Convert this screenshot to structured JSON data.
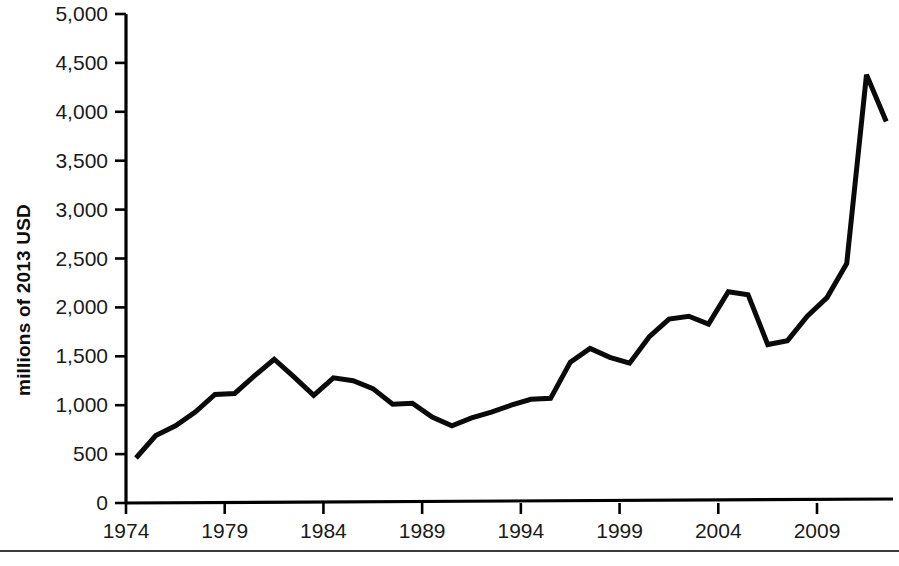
{
  "chart_data": {
    "type": "line",
    "title": "",
    "subtitle": "",
    "xlabel": "",
    "ylabel": "millions of 2013 USD",
    "xlim": [
      1974,
      2012
    ],
    "ylim": [
      0,
      5000
    ],
    "ytick_values": [
      0,
      500,
      1000,
      1500,
      2000,
      2500,
      3000,
      3500,
      4000,
      4500,
      5000
    ],
    "ytick_labels": [
      "0",
      "500",
      "1,000",
      "1,500",
      "2,000",
      "2,500",
      "3,000",
      "3,500",
      "4,000",
      "4,500",
      "5,000"
    ],
    "xtick_values": [
      1974,
      1979,
      1984,
      1989,
      1994,
      1999,
      2004,
      2009
    ],
    "xtick_labels": [
      "1974",
      "1979",
      "1984",
      "1989",
      "1994",
      "1999",
      "2004",
      "2009"
    ],
    "grid": false,
    "legend": false,
    "legend_position": "none",
    "line_color": "#0a0a0a",
    "x": [
      1974,
      1975,
      1976,
      1977,
      1978,
      1979,
      1980,
      1981,
      1982,
      1983,
      1984,
      1985,
      1986,
      1987,
      1988,
      1989,
      1990,
      1991,
      1992,
      1993,
      1994,
      1995,
      1996,
      1997,
      1998,
      1999,
      2000,
      2001,
      2002,
      2003,
      2004,
      2005,
      2006,
      2007,
      2008,
      2009,
      2010,
      2011,
      2012
    ],
    "values": [
      460,
      690,
      790,
      930,
      1110,
      1120,
      1300,
      1470,
      1290,
      1100,
      1280,
      1250,
      1170,
      1010,
      1020,
      880,
      790,
      870,
      930,
      1000,
      1060,
      1070,
      1440,
      1580,
      1490,
      1430,
      1700,
      1880,
      1910,
      1830,
      2160,
      2130,
      1620,
      1660,
      1910,
      2100,
      2450,
      4380,
      3900
    ]
  },
  "axis": {
    "y_title": "millions of 2013 USD"
  },
  "icons": {
    "chart_line": "line-chart-icon"
  }
}
